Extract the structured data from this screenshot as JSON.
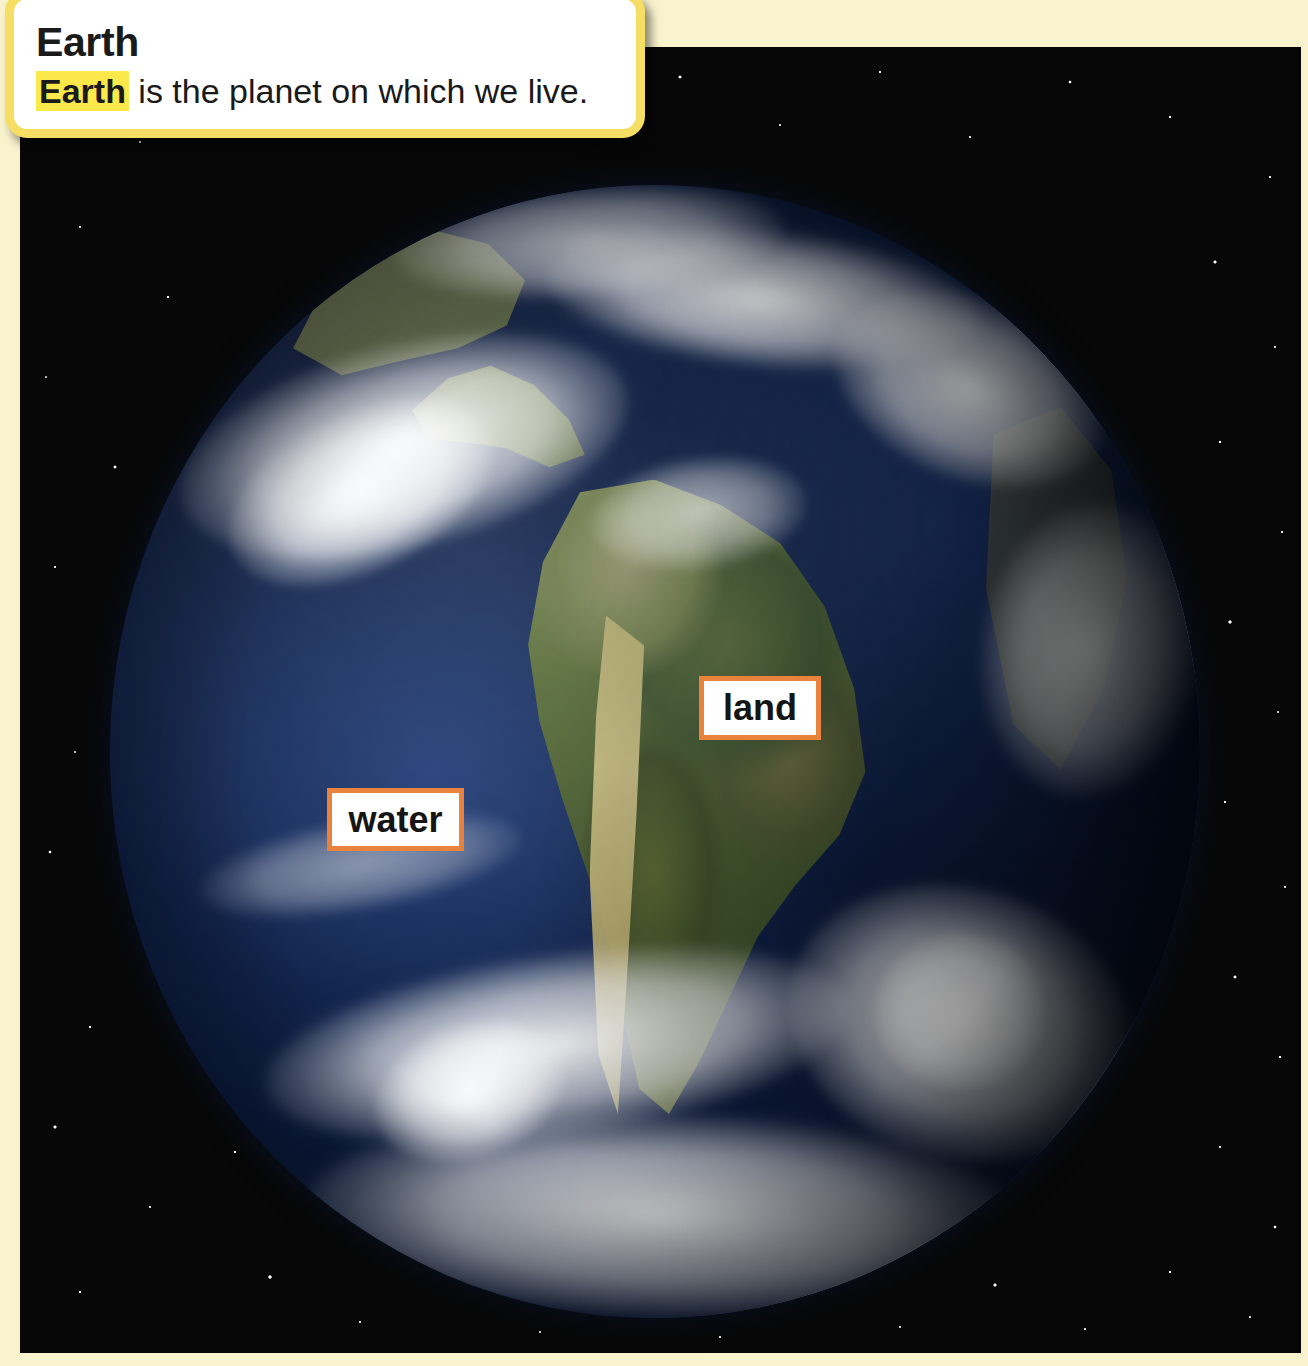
{
  "page": {
    "background_color": "#f8f2cd"
  },
  "title_card": {
    "heading": "Earth",
    "body_term": "Earth",
    "body_rest": " is the planet on which we live.",
    "highlight_color": "#fbe94c",
    "border_color": "#f6dd63",
    "background_color": "#ffffff"
  },
  "photo": {
    "subject": "earth-from-space",
    "space_color": "#070707",
    "globe": {
      "ocean_color": "#1d3straight",
      "land_color": "#4e6135",
      "cloud_color": "#ffffff"
    }
  },
  "callouts": [
    {
      "id": "land",
      "label": "land",
      "border_color": "#e8823c",
      "background_color": "#ffffff"
    },
    {
      "id": "water",
      "label": "water",
      "border_color": "#e8823c",
      "background_color": "#ffffff"
    }
  ]
}
